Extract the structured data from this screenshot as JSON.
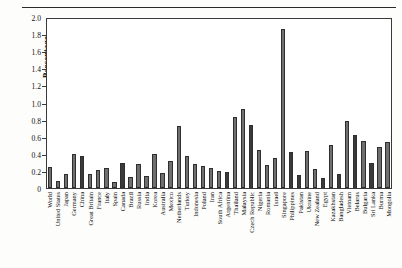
{
  "chart_data": {
    "type": "bar",
    "title": "",
    "xlabel": "",
    "ylabel": "Percentage",
    "ylim": [
      0,
      2.0
    ],
    "yticks": [
      "0",
      "0.2",
      "0.4",
      "0.6",
      "0.8",
      "1.0",
      "1.2",
      "1.4",
      "1.6",
      "1.8",
      "2.0"
    ],
    "ytick_values": [
      0,
      0.2,
      0.4,
      0.6,
      0.8,
      1.0,
      1.2,
      1.4,
      1.6,
      1.8,
      2.0
    ],
    "grid": false,
    "legend": "none",
    "categories": [
      "World",
      "United States",
      "Japan",
      "Germany",
      "China",
      "Great Britain",
      "France",
      "Italy",
      "Spain",
      "Canada",
      "Brazil",
      "Russia",
      "India",
      "Korea",
      "Australia",
      "Mexico",
      "Netherlands",
      "Turkey",
      "Indonesia",
      "Poland",
      "Iran",
      "South Africa",
      "Argentina",
      "Thailand",
      "Malaysia",
      "Czech Republic",
      "Nigeria",
      "Romania",
      "Israel",
      "Singapore",
      "Philippines",
      "Pakistan",
      "Ukraine",
      "New Zealand",
      "Egypt",
      "Kazakhstan",
      "Bangladesh",
      "Vietnam",
      "Belarus",
      "Bulgaria",
      "Sri Lanka",
      "Burma",
      "Mongolia"
    ],
    "values": [
      0.25,
      0.08,
      0.16,
      0.4,
      0.38,
      0.16,
      0.21,
      0.23,
      0.07,
      0.29,
      0.13,
      0.28,
      0.14,
      0.4,
      0.17,
      0.32,
      0.73,
      0.38,
      0.28,
      0.26,
      0.23,
      0.2,
      0.19,
      0.83,
      0.92,
      0.74,
      0.45,
      0.27,
      0.35,
      1.86,
      0.42,
      0.15,
      0.43,
      0.22,
      0.12,
      0.5,
      0.16,
      0.78,
      0.62,
      0.55,
      0.29,
      0.48,
      0.54
    ],
    "shades": [
      "mid",
      "mid",
      "mid",
      "mid",
      "dark",
      "mid",
      "mid",
      "mid",
      "mid",
      "dark",
      "mid",
      "mid",
      "mid",
      "mid",
      "mid",
      "mid",
      "mid",
      "mid",
      "mid",
      "mid",
      "mid",
      "mid",
      "dark",
      "mid",
      "mid",
      "dark",
      "mid",
      "mid",
      "mid",
      "mid",
      "dark",
      "dark",
      "mid",
      "mid",
      "dark",
      "mid",
      "dark",
      "mid",
      "dark",
      "mid",
      "dark",
      "mid",
      "mid"
    ]
  }
}
